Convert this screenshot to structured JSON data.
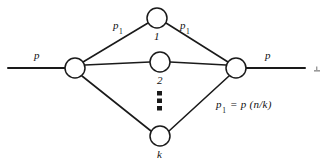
{
  "figure": {
    "type": "network-fanout-diagram",
    "background_color": "#ffffff",
    "stroke_color": "#1a1a1a",
    "node_fill": "#ffffff"
  },
  "labels": {
    "left_flow": "p",
    "right_flow": "p",
    "branch_left": "p",
    "branch_left_sub": "1",
    "branch_right": "p",
    "branch_right_sub": "1",
    "node_top": "1",
    "node_middle": "2",
    "node_bottom": "k",
    "vertical_ellipsis": "⋮",
    "equation_lhs": "p",
    "equation_lhs_sub": "1",
    "equation_rhs": "= p (n/k)"
  },
  "nodes": [
    {
      "name": "left-hub",
      "cx": 75,
      "cy": 68,
      "r": 10,
      "label": ""
    },
    {
      "name": "branch-1",
      "cx": 157,
      "cy": 18,
      "r": 10,
      "label": "1"
    },
    {
      "name": "branch-2",
      "cx": 160,
      "cy": 62,
      "r": 10,
      "label": "2"
    },
    {
      "name": "branch-k",
      "cx": 160,
      "cy": 136,
      "r": 10,
      "label": "k"
    },
    {
      "name": "right-hub",
      "cx": 236,
      "cy": 68,
      "r": 10,
      "label": ""
    }
  ],
  "edges": [
    {
      "name": "input-line",
      "from": [
        8,
        68
      ],
      "to": [
        65,
        68
      ]
    },
    {
      "name": "output-line",
      "from": [
        246,
        68
      ],
      "to": [
        305,
        68
      ]
    },
    {
      "name": "left-to-branch-1",
      "from": [
        83,
        62
      ],
      "to": [
        148,
        23
      ]
    },
    {
      "name": "left-to-branch-2",
      "from": [
        85,
        65
      ],
      "to": [
        150,
        62
      ]
    },
    {
      "name": "left-to-branch-k",
      "from": [
        82,
        76
      ],
      "to": [
        151,
        131
      ]
    },
    {
      "name": "branch-1-to-right",
      "from": [
        166,
        23
      ],
      "to": [
        228,
        62
      ]
    },
    {
      "name": "branch-2-to-right",
      "from": [
        170,
        62
      ],
      "to": [
        226,
        65
      ]
    },
    {
      "name": "branch-k-to-right",
      "from": [
        169,
        131
      ],
      "to": [
        229,
        76
      ]
    }
  ],
  "ellipsis_dots": [
    {
      "cx": 160,
      "cy": 94
    },
    {
      "cx": 160,
      "cy": 101
    },
    {
      "cx": 160,
      "cy": 108
    }
  ]
}
